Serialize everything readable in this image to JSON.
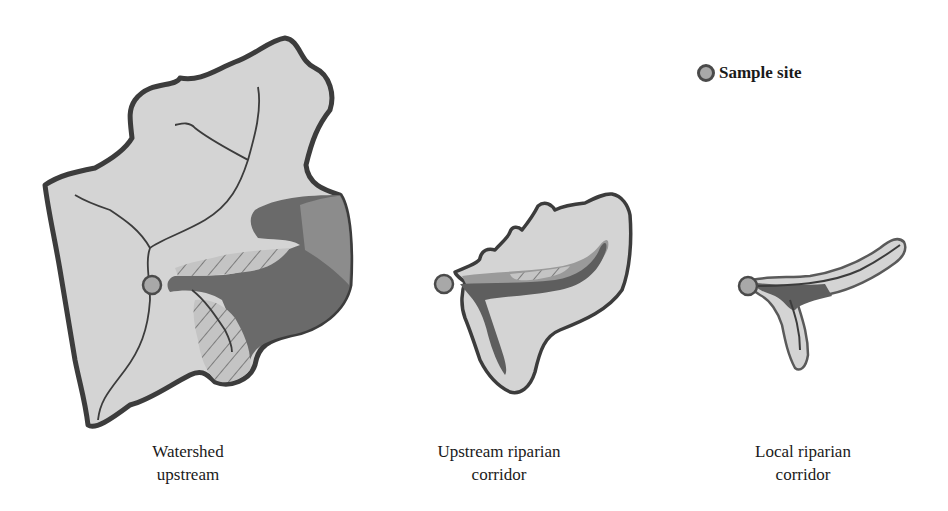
{
  "diagram": {
    "legend": {
      "icon": "sample-site-marker",
      "label": "Sample site"
    },
    "panels": [
      {
        "id": "watershed",
        "caption_line1": "Watershed",
        "caption_line2": "upstream"
      },
      {
        "id": "upstream-corridor",
        "caption_line1": "Upstream riparian",
        "caption_line2": "corridor"
      },
      {
        "id": "local-corridor",
        "caption_line1": "Local riparian",
        "caption_line2": "corridor"
      }
    ],
    "colors": {
      "land_fill": "#d4d4d4",
      "outline": "#3c3c3c",
      "riparian_dark": "#5e5e5e",
      "riparian_mid": "#8a8a8a",
      "sample_site": "#a8a8a8"
    }
  }
}
